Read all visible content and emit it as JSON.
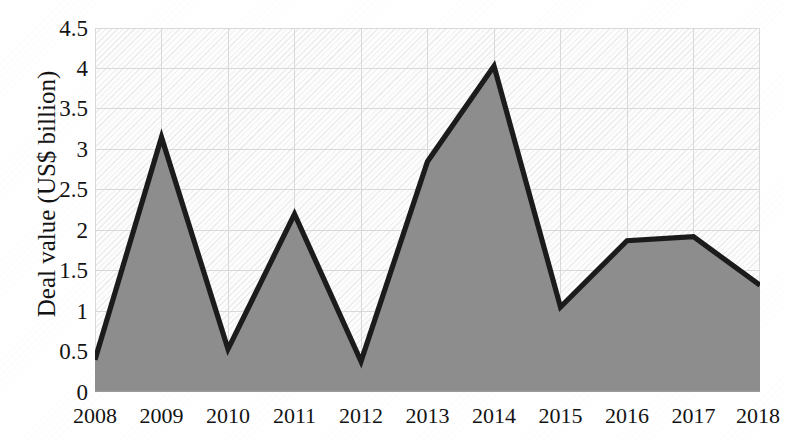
{
  "chart_data": {
    "type": "area",
    "title": "",
    "subtitle": "",
    "xlabel": "",
    "ylabel": "Deal value (US$ billion)",
    "categories": [
      "2008",
      "2009",
      "2010",
      "2011",
      "2012",
      "2013",
      "2014",
      "2015",
      "2016",
      "2017",
      "2018"
    ],
    "values": [
      0.4,
      3.15,
      0.53,
      2.2,
      0.38,
      2.85,
      4.03,
      1.05,
      1.87,
      1.92,
      1.32
    ],
    "series": [
      {
        "name": "Deal value",
        "values": [
          0.4,
          3.15,
          0.53,
          2.2,
          0.38,
          2.85,
          4.03,
          1.05,
          1.87,
          1.92,
          1.32
        ]
      }
    ],
    "ylim": [
      0,
      4.5
    ],
    "y_ticks": [
      "0",
      "0.5",
      "1",
      "1.5",
      "2",
      "2.5",
      "3",
      "3.5",
      "4",
      "4.5"
    ],
    "y_tick_values": [
      0,
      0.5,
      1,
      1.5,
      2,
      2.5,
      3,
      3.5,
      4,
      4.5
    ],
    "x_ticks": [
      "2008",
      "2009",
      "2010",
      "2011",
      "2012",
      "2013",
      "2014",
      "2015",
      "2016",
      "2017",
      "2018"
    ],
    "grid": true,
    "grid_axes": "both",
    "legend": false,
    "legend_position": "none",
    "colors": {
      "area_fill": "#8d8d8d",
      "area_line": "#1b1b1b",
      "gridline": "#d9d9d9",
      "axis_line": "#9a9a9a",
      "plot_background": "#fdfdfd",
      "text": "#131313"
    },
    "annotations": []
  }
}
